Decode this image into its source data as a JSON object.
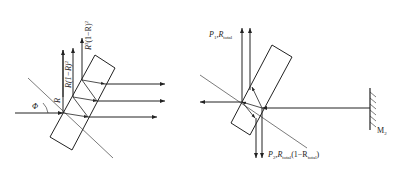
{
  "left_diagram": {
    "angle_label": "Φ",
    "reflect_label": "R",
    "beam1_label": "R(1−R)",
    "beam1_sup": "2",
    "beam2_label": "R",
    "beam2_sup": "3",
    "beam2_tail": "(1−R)",
    "beam2_tail_sup": "2"
  },
  "right_diagram": {
    "top_label_p": "P",
    "top_label_p_sub": "1",
    "top_label_r": ",R",
    "top_label_r_sub": "total",
    "bottom_label_p": "P",
    "bottom_label_p_sub": "2",
    "bottom_label_r": ",R",
    "bottom_label_r_sub": "total",
    "bottom_label_mid": "(1−R",
    "bottom_label_mid_sub": "total",
    "bottom_label_end": ")",
    "mirror_label": "M",
    "mirror_label_sub": "2"
  },
  "colors": {
    "line": "#222222",
    "background": "#ffffff"
  }
}
